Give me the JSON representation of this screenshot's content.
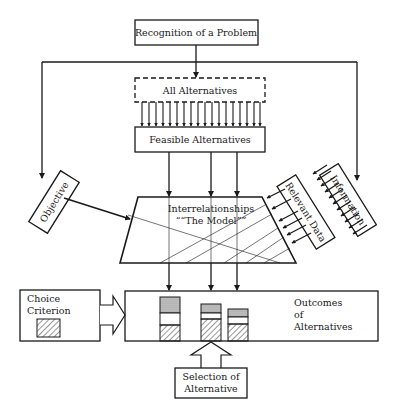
{
  "diagram": {
    "nodes": {
      "recognition": "Recognition of a Problem",
      "all_alternatives": "All Alternatives",
      "feasible_alternatives": "Feasible Alternatives",
      "objective": "Objective",
      "information": "Information",
      "relevant_data": "Relevant Data",
      "model_line1": "Interrelationships",
      "model_line2": "““The Model””",
      "choice_line1": "Choice",
      "choice_line2": "Criterion",
      "outcomes_line1": "Outcomes",
      "outcomes_line2": "of",
      "outcomes_line3": "Alternatives",
      "selection_line1": "Selection of",
      "selection_line2": "Alternative"
    },
    "colors": {
      "ink": "#1a1a1a",
      "background": "#ffffff"
    }
  }
}
